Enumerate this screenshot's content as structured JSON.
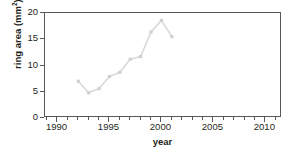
{
  "chart_data": {
    "type": "line",
    "title": "",
    "xlabel": "year",
    "ylabel": "ring area (mm2)",
    "ylabel_base": "ring area (mm",
    "ylabel_sup": "2",
    "ylabel_close": ")",
    "x": [
      1992,
      1993,
      1994,
      1995,
      1996,
      1997,
      1998,
      1999,
      2000,
      2001
    ],
    "values": [
      7.0,
      4.8,
      5.6,
      7.9,
      8.7,
      11.2,
      11.7,
      16.4,
      18.6,
      15.5
    ],
    "series": [
      {
        "name": "ring area",
        "values": [
          7.0,
          4.8,
          5.6,
          7.9,
          8.7,
          11.2,
          11.7,
          16.4,
          18.6,
          15.5
        ]
      }
    ],
    "xlim": [
      1988.8,
      2011.6
    ],
    "ylim": [
      0,
      20
    ],
    "xticks": [
      1990,
      1995,
      2000,
      2005,
      2010
    ],
    "xtick_labels": [
      "1990",
      "1995",
      "2000",
      "2005",
      "2010"
    ],
    "xminor_step": 1,
    "yticks": [
      0,
      5,
      10,
      15,
      20
    ],
    "ytick_labels": [
      "0",
      "5",
      "10",
      "15",
      "20"
    ],
    "grid": false,
    "legend": false,
    "marker": "square",
    "line_color": "#d9d9d9",
    "marker_color": "#d0d0d0",
    "axis_color": "#58585a",
    "text_color": "#231f20",
    "background": "#ffffff"
  }
}
